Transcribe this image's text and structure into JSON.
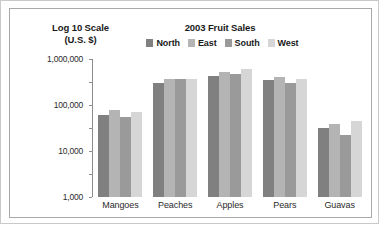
{
  "chart_data": {
    "type": "bar",
    "title": "2003 Fruit Sales",
    "ylabel_line1": "Log 10 Scale",
    "ylabel_line2": "(U.S. $)",
    "xlabel": "",
    "scale": "log10",
    "ylim": [
      1,
      1000000
    ],
    "grid": false,
    "legend_position": "top-center",
    "ytick_labels": [
      "1,000,000",
      "100,000",
      "10,000",
      "1,000",
      "100",
      "10",
      "1"
    ],
    "ytick_values": [
      1000000,
      100000,
      10000,
      1000,
      100,
      10,
      1
    ],
    "categories": [
      "Mangoes",
      "Peaches",
      "Apples",
      "Pears",
      "Guavas"
    ],
    "series": [
      {
        "name": "North",
        "color": "#808080",
        "values": [
          3800,
          95000,
          190000,
          120000,
          1000
        ]
      },
      {
        "name": "East",
        "color": "#b4b4b4",
        "values": [
          6000,
          140000,
          260000,
          170000,
          1500
        ]
      },
      {
        "name": "South",
        "color": "#9a9a9a",
        "values": [
          3000,
          140000,
          230000,
          95000,
          500
        ]
      },
      {
        "name": "West",
        "color": "#d6d6d6",
        "values": [
          4800,
          140000,
          360000,
          135000,
          2000
        ]
      }
    ]
  }
}
